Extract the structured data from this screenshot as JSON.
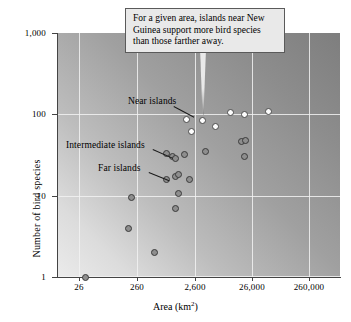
{
  "chart_data": {
    "type": "scatter",
    "title": "",
    "xlabel": "Area (km2)",
    "xlabel_base": "Area (km",
    "xlabel_sup": "2",
    "xlabel_tail": ")",
    "ylabel": "Number of bird species",
    "xscale": "log",
    "yscale": "log",
    "xticks": [
      "26",
      "260",
      "2,600",
      "26,000",
      "260,000"
    ],
    "xtick_values": [
      26,
      260,
      2600,
      26000,
      260000
    ],
    "yticks": [
      "1,000",
      "100",
      "10",
      "1"
    ],
    "ytick_values": [
      1000,
      100,
      10,
      1
    ],
    "xlim": [
      8.2,
      822000
    ],
    "ylim": [
      1,
      1000
    ],
    "grid": true,
    "legend": "none",
    "series": [
      {
        "name": "Near islands",
        "marker": "open-circle",
        "color": "#fdfdfd",
        "edge_color": "#4a4a4a",
        "points": [
          {
            "area": 1600,
            "species": 86
          },
          {
            "area": 1950,
            "species": 62
          },
          {
            "area": 3100,
            "species": 85
          },
          {
            "area": 5200,
            "species": 70
          },
          {
            "area": 9500,
            "species": 105
          },
          {
            "area": 17000,
            "species": 100
          },
          {
            "area": 44000,
            "species": 107
          }
        ]
      },
      {
        "name": "Intermediate islands",
        "marker": "filled-circle",
        "color": "#8e8e8e",
        "edge_color": "#3a3a3a",
        "points": [
          {
            "area": 700,
            "species": 33
          },
          {
            "area": 900,
            "species": 30
          },
          {
            "area": 1000,
            "species": 29
          },
          {
            "area": 1450,
            "species": 32
          },
          {
            "area": 3400,
            "species": 35
          },
          {
            "area": 15000,
            "species": 47
          },
          {
            "area": 17500,
            "species": 48
          },
          {
            "area": 17000,
            "species": 30
          }
        ]
      },
      {
        "name": "Far islands",
        "marker": "filled-circle",
        "color": "#8e8e8e",
        "edge_color": "#3a3a3a",
        "points": [
          {
            "area": 700,
            "species": 16
          },
          {
            "area": 1000,
            "species": 17
          },
          {
            "area": 1150,
            "species": 18
          },
          {
            "area": 1800,
            "species": 16
          },
          {
            "area": 1150,
            "species": 10.5
          },
          {
            "area": 1000,
            "species": 7
          },
          {
            "area": 170,
            "species": 9.5
          },
          {
            "area": 150,
            "species": 4
          },
          {
            "area": 430,
            "species": 2
          },
          {
            "area": 26,
            "species": 1
          }
        ]
      }
    ],
    "annotations": [
      {
        "name": "near-islands-label",
        "text": "Near islands"
      },
      {
        "name": "intermediate-islands-label",
        "text": "Intermediate islands"
      },
      {
        "name": "far-islands-label",
        "text": "Far islands"
      },
      {
        "name": "callout",
        "text": "For a given area, islands near New Guinea support more bird species than those farther away."
      }
    ]
  },
  "callout": {
    "line1": "For a given area, islands near New",
    "line2": "Guinea support more bird species",
    "line3": "than those farther away."
  },
  "labels": {
    "near": "Near islands",
    "intermediate": "Intermediate islands",
    "far": "Far islands"
  },
  "axes": {
    "y_title": "Number of bird species",
    "x_title_base": "Area (km",
    "x_title_sup": "2",
    "x_title_tail": ")"
  },
  "colors": {
    "background_dark": "#7e7e7e",
    "background_light": "#ebebeb",
    "gridline": "#f2f2f2",
    "axis": "#444444",
    "near_marker": "#fdfdfd",
    "other_marker": "#8e8e8e",
    "callout_bg": "#e9e9e9"
  }
}
